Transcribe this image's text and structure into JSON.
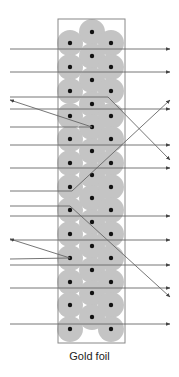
{
  "figure": {
    "caption": "Gold foil",
    "colors": {
      "atom_cloud": "#c4c4c4",
      "nucleus": "#111111",
      "beam": "#666666",
      "frame": "#888888",
      "background": "#ffffff"
    },
    "foil_frame": {
      "x": 58,
      "y": 19,
      "width": 67,
      "height": 324
    },
    "atoms": {
      "radius": 13,
      "nucleus_radius": 2.2,
      "center_column_x": 92,
      "side_columns_x": [
        70,
        111
      ],
      "center_rows_y": [
        32,
        56,
        80,
        104,
        127,
        151,
        175,
        198,
        222,
        246,
        270,
        293,
        317
      ],
      "side_rows_y": [
        43,
        67,
        91,
        116,
        139,
        163,
        187,
        210,
        234,
        258,
        282,
        305,
        329
      ]
    },
    "beams": [
      {
        "type": "straight",
        "points": [
          [
            10,
            49
          ],
          [
            170,
            49
          ]
        ]
      },
      {
        "type": "straight",
        "points": [
          [
            10,
            72
          ],
          [
            170,
            72
          ]
        ]
      },
      {
        "type": "deflected",
        "points": [
          [
            10,
            97
          ],
          [
            108,
            97
          ],
          [
            170,
            160
          ]
        ]
      },
      {
        "type": "straight",
        "points": [
          [
            10,
            109
          ],
          [
            170,
            109
          ]
        ]
      },
      {
        "type": "reflected",
        "points": [
          [
            10,
            127
          ],
          [
            92,
            127
          ],
          [
            10,
            100
          ]
        ]
      },
      {
        "type": "straight",
        "points": [
          [
            10,
            145
          ],
          [
            170,
            145
          ]
        ]
      },
      {
        "type": "straight",
        "points": [
          [
            10,
            168
          ],
          [
            170,
            168
          ]
        ]
      },
      {
        "type": "deflected",
        "points": [
          [
            10,
            191
          ],
          [
            72,
            191
          ],
          [
            170,
            100
          ]
        ]
      },
      {
        "type": "deflected",
        "points": [
          [
            10,
            206
          ],
          [
            70,
            206
          ],
          [
            170,
            297
          ]
        ]
      },
      {
        "type": "straight",
        "points": [
          [
            10,
            216
          ],
          [
            170,
            216
          ]
        ]
      },
      {
        "type": "straight",
        "points": [
          [
            10,
            240
          ],
          [
            170,
            240
          ]
        ]
      },
      {
        "type": "reflected",
        "points": [
          [
            10,
            259
          ],
          [
            70,
            258
          ],
          [
            10,
            239
          ]
        ]
      },
      {
        "type": "straight",
        "points": [
          [
            10,
            265
          ],
          [
            170,
            265
          ]
        ]
      },
      {
        "type": "straight",
        "points": [
          [
            10,
            288
          ],
          [
            170,
            288
          ]
        ]
      },
      {
        "type": "straight",
        "points": [
          [
            10,
            324
          ],
          [
            170,
            324
          ]
        ]
      }
    ]
  }
}
